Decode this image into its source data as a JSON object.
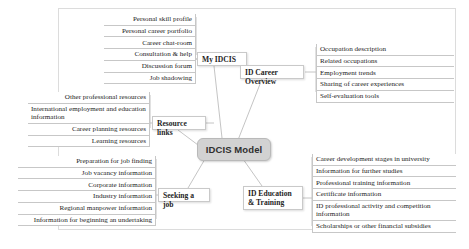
{
  "diagram": {
    "type": "mind-map",
    "center": {
      "label": "IDCIS Model",
      "color": "#d2d2d2"
    },
    "branches": [
      {
        "id": "my-idcis",
        "label": "My IDCIS",
        "side": "left",
        "leaves": [
          "Personal skill profile",
          "Personal career portfolio",
          "Career chat-room",
          "Consultation & help",
          "Discussion forum",
          "Job shadowing"
        ]
      },
      {
        "id": "id-career-overview",
        "label": "ID Career Overview",
        "side": "right",
        "leaves": [
          "Occupation description",
          "Related occupations",
          "Employment trends",
          "Sharing of career experiences",
          "Self-evaluation tools"
        ]
      },
      {
        "id": "resource-links",
        "label": "Resource links",
        "side": "left",
        "leaves": [
          "Other professional resources",
          "International employment and education information",
          "Career planning resources",
          "Learning resources"
        ]
      },
      {
        "id": "seeking-a-job",
        "label": "Seeking a job",
        "side": "left",
        "leaves": [
          "Preparation for job finding",
          "Job vacancy information",
          "Corporate information",
          "Industry information",
          "Regional manpower information",
          "Information for beginning an undertaking"
        ]
      },
      {
        "id": "id-education-training",
        "label": "ID Education & Training",
        "side": "right",
        "leaves": [
          "Career development stages in university",
          "Information for further studies",
          "Professional training information",
          "Certificate information",
          "ID professional activity and competition information",
          "Scholarships or other financial subsidies"
        ]
      }
    ]
  }
}
